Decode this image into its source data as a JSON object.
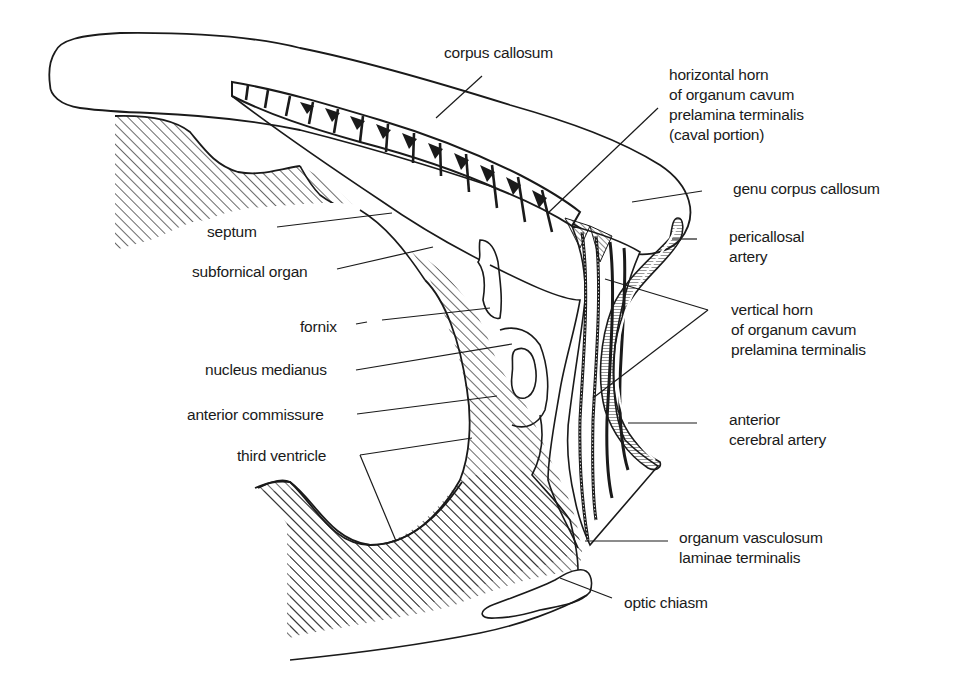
{
  "figure": {
    "ink_color": "#1a1a1a",
    "background": "#ffffff"
  },
  "labels": {
    "corpus_callosum": [
      "corpus callosum"
    ],
    "horizontal_horn": [
      "horizontal horn",
      "of organum cavum",
      "prelamina terminalis",
      "(caval portion)"
    ],
    "genu_corpus_callosum": [
      "genu corpus callosum"
    ],
    "pericallosal_artery": [
      "pericallosal",
      "artery"
    ],
    "vertical_horn": [
      "vertical horn",
      "of organum cavum",
      "prelamina terminalis"
    ],
    "anterior_cerebral_artery": [
      "anterior",
      "cerebral artery"
    ],
    "organum_vasculosum": [
      "organum vasculosum",
      "laminae terminalis"
    ],
    "optic_chiasm": [
      "optic chiasm"
    ],
    "septum": [
      "septum"
    ],
    "subfornical_organ": [
      "subfornical organ"
    ],
    "fornix": [
      "fornix"
    ],
    "nucleus_medianus": [
      "nucleus medianus"
    ],
    "anterior_commissure": [
      "anterior commissure"
    ],
    "third_ventricle": [
      "third ventricle"
    ]
  }
}
